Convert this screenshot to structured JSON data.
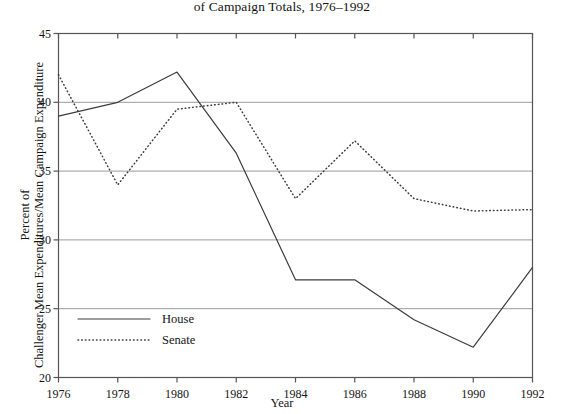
{
  "chart_data": {
    "type": "line",
    "title": "of Campaign Totals, 1976–1992",
    "title_note": "title is clipped at top of screenshot",
    "xlabel": "Year",
    "ylabel_line1": "Percent of",
    "ylabel_line2": "Challenger Mean Expenditures/Mean Campaign Expenditure",
    "x": [
      1976,
      1978,
      1980,
      1982,
      1984,
      1986,
      1988,
      1990,
      1992
    ],
    "xtick_labels": [
      "1976",
      "1978",
      "1980",
      "1982",
      "1984",
      "1986",
      "1988",
      "1990",
      "1992"
    ],
    "ytick_labels": [
      "20",
      "25",
      "30",
      "35",
      "40",
      "45"
    ],
    "yticks": [
      20,
      25,
      30,
      35,
      40,
      45
    ],
    "xlim": [
      1976,
      1992
    ],
    "ylim": [
      20,
      45
    ],
    "grid": "horizontal",
    "legend_position": "lower-left-inside",
    "series": [
      {
        "name": "House",
        "style": "solid",
        "color": "#3c3c3c",
        "values": [
          39.0,
          40.0,
          42.2,
          36.3,
          27.1,
          27.1,
          24.2,
          22.2,
          28.0
        ]
      },
      {
        "name": "Senate",
        "style": "dotted",
        "color": "#3c3c3c",
        "values": [
          42.0,
          34.0,
          39.5,
          40.0,
          33.0,
          37.2,
          33.0,
          32.1,
          32.2
        ]
      }
    ]
  },
  "colors": {
    "background": "#ffffff",
    "axis": "#555555",
    "gridline": "#9a9a9a",
    "text": "#141414"
  }
}
